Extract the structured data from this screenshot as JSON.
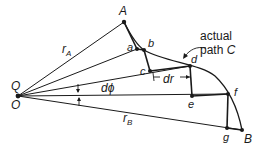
{
  "diagram": {
    "points": {
      "O": {
        "label": "O",
        "x": 18,
        "y": 96
      },
      "Q": {
        "label": "Q"
      },
      "A": {
        "label": "A",
        "x": 124,
        "y": 22
      },
      "a": {
        "label": "a",
        "x": 137,
        "y": 49
      },
      "b": {
        "label": "b",
        "x": 144,
        "y": 50
      },
      "c": {
        "label": "c",
        "x": 150,
        "y": 71
      },
      "d": {
        "label": "d",
        "x": 190,
        "y": 66
      },
      "e": {
        "label": "e",
        "x": 192,
        "y": 96
      },
      "f": {
        "label": "f",
        "x": 228,
        "y": 94
      },
      "g": {
        "label": "g",
        "x": 227,
        "y": 128
      },
      "B": {
        "label": "B",
        "x": 242,
        "y": 130
      }
    },
    "labels": {
      "rA": "r",
      "rA_sub": "A",
      "rB": "r",
      "rB_sub": "B",
      "dphi": "dϕ",
      "dr": "dr",
      "path_line1": "actual",
      "path_line2": "path ",
      "path_C": "C"
    },
    "colors": {
      "ink": "#1a1a1a",
      "background": "#ffffff"
    }
  }
}
